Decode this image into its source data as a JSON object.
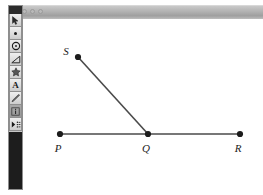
{
  "window": {
    "title": "",
    "controls": [
      {
        "name": "close",
        "color": "#b9b9b9"
      },
      {
        "name": "minimize",
        "color": "#b9b9b9"
      },
      {
        "name": "zoom",
        "color": "#b9b9b9"
      }
    ]
  },
  "toolbar": {
    "tools": [
      {
        "id": "arrow",
        "icon": "arrow-pointer-icon",
        "label": "Selection Arrow Tool",
        "selected": false
      },
      {
        "id": "point",
        "icon": "point-icon",
        "label": "Point Tool",
        "selected": false
      },
      {
        "id": "circle",
        "icon": "circle-icon",
        "label": "Compass (Circle) Tool",
        "selected": false
      },
      {
        "id": "line",
        "icon": "straightedge-icon",
        "label": "Straightedge Tool",
        "selected": false
      },
      {
        "id": "polygon",
        "icon": "polygon-icon",
        "label": "Polygon Tool",
        "selected": false
      },
      {
        "id": "text",
        "icon": "text-a-icon",
        "label": "Text Tool",
        "selected": false,
        "glyph": "A"
      },
      {
        "id": "marker",
        "icon": "marker-pen-icon",
        "label": "Marker Tool",
        "selected": false
      },
      {
        "id": "info",
        "icon": "information-icon",
        "label": "Information Tool",
        "selected": true
      },
      {
        "id": "custom",
        "icon": "custom-tools-icon",
        "label": "Custom Tools",
        "selected": false
      }
    ]
  },
  "figure": {
    "type": "geometry-diagram",
    "points": [
      {
        "id": "S",
        "label": "S",
        "x": 54,
        "y": 38,
        "label_x": 42,
        "label_y": 36
      },
      {
        "id": "P",
        "label": "P",
        "x": 36,
        "y": 115,
        "label_x": 31,
        "label_y": 133
      },
      {
        "id": "Q",
        "label": "Q",
        "x": 124,
        "y": 115,
        "label_x": 119,
        "label_y": 133
      },
      {
        "id": "R",
        "label": "R",
        "x": 216,
        "y": 115,
        "label_x": 211,
        "label_y": 133
      }
    ],
    "segments": [
      {
        "id": "PR",
        "from": "P",
        "to": "R"
      },
      {
        "id": "QS",
        "from": "Q",
        "to": "S"
      }
    ],
    "colors": {
      "line": "#4a4a4a",
      "point": "#1c1c1c",
      "label": "#1c1c1c"
    }
  }
}
